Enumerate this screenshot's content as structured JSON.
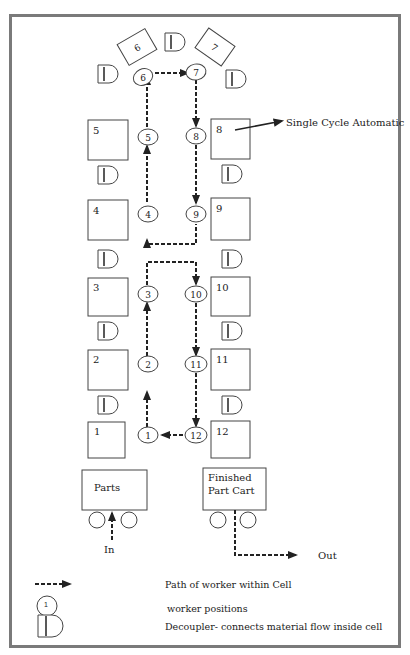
{
  "machines": [
    {
      "id": "m1",
      "label": "1",
      "side": "left"
    },
    {
      "id": "m2",
      "label": "2",
      "side": "left"
    },
    {
      "id": "m3",
      "label": "3",
      "side": "left"
    },
    {
      "id": "m4",
      "label": "4",
      "side": "left"
    },
    {
      "id": "m5",
      "label": "5",
      "side": "left"
    },
    {
      "id": "m6",
      "label": "6",
      "side": "top"
    },
    {
      "id": "m7",
      "label": "7",
      "side": "top"
    },
    {
      "id": "m8",
      "label": "8",
      "side": "right"
    },
    {
      "id": "m9",
      "label": "9",
      "side": "right"
    },
    {
      "id": "m10",
      "label": "10",
      "side": "right"
    },
    {
      "id": "m11",
      "label": "11",
      "side": "right"
    },
    {
      "id": "m12",
      "label": "12",
      "side": "right"
    }
  ],
  "workers": [
    "1",
    "2",
    "3",
    "4",
    "5",
    "6",
    "7",
    "8",
    "9",
    "10",
    "11",
    "12"
  ],
  "annotation": {
    "label": "Single Cycle Automatic",
    "target": "8"
  },
  "carts": {
    "parts": {
      "label": "Parts",
      "flow_label": "In"
    },
    "finished": {
      "label_line1": "Finished",
      "label_line2": "Part Cart",
      "flow_label": "Out"
    }
  },
  "legend": {
    "path_label": "Path of worker within Cell",
    "worker_symbol": "1",
    "worker_label": "worker positions",
    "decoupler_label": "Decoupler- connects material flow inside cell"
  },
  "colors": {
    "frame": "#7a7a7a",
    "line": "#333333",
    "path": "#222222"
  }
}
